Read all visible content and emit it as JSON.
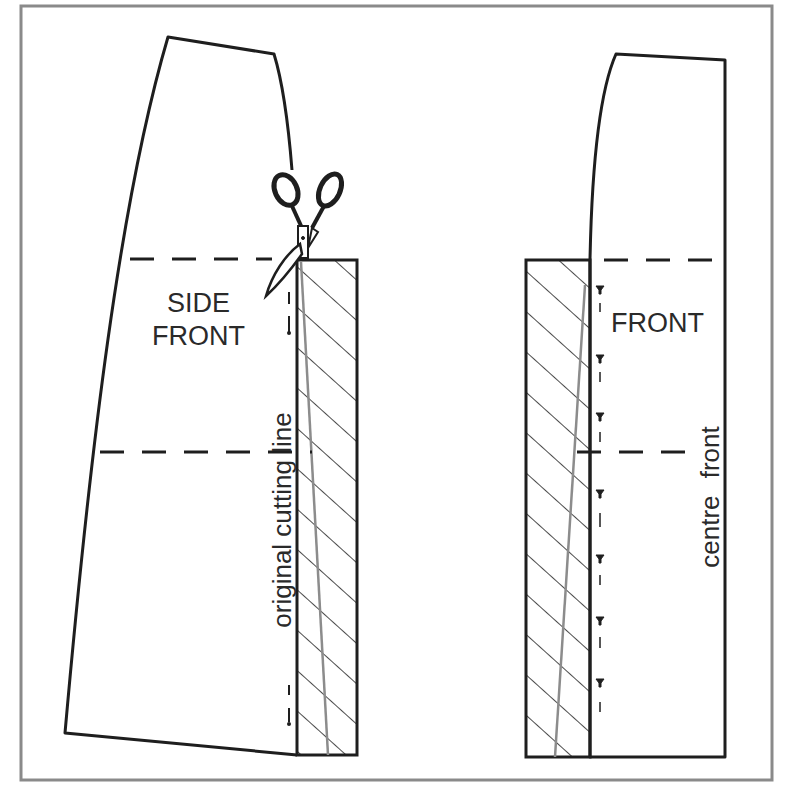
{
  "figure": {
    "colors": {
      "ink": "#1e1e1e",
      "frame": "#8a8a8a",
      "guide_line": "#8c8c8c",
      "background": "#ffffff"
    }
  },
  "pieces": {
    "side_front": {
      "label_line1": "SIDE",
      "label_line2": "FRONT",
      "vertical_label": "original cutting line"
    },
    "front": {
      "label": "FRONT",
      "vertical_label": "centre front"
    }
  },
  "icons": {
    "scissors": "scissors-icon",
    "pins": "pin-icon"
  }
}
